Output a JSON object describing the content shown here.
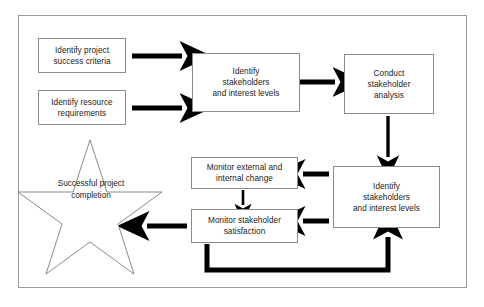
{
  "diagram": {
    "frame": {
      "border_color": "#9a9a9a",
      "background": "#ffffff"
    },
    "style": {
      "box_border_color": "#8c8c8c",
      "arrow_color": "#000000",
      "text_color": "#1a1a1a"
    },
    "nodes": [
      {
        "id": "identify-project-success-criteria",
        "shape": "rectangle",
        "line1": "Identify project",
        "line2": "success criteria",
        "line3": ""
      },
      {
        "id": "identify-resource-requirements",
        "shape": "rectangle",
        "line1": "Identify resource",
        "line2": "requirements",
        "line3": ""
      },
      {
        "id": "identify-stakeholders-and-interest-levels-top",
        "shape": "rectangle",
        "line1": "Identify",
        "line2": "stakeholders",
        "line3": "and interest levels"
      },
      {
        "id": "conduct-stakeholder-analysis",
        "shape": "rectangle",
        "line1": "Conduct",
        "line2": "stakeholder",
        "line3": "analysis"
      },
      {
        "id": "identify-stakeholders-and-interest-levels-bottom",
        "shape": "rectangle",
        "line1": "Identify",
        "line2": "stakeholders",
        "line3": "and interest levels"
      },
      {
        "id": "monitor-external-and-internal-change",
        "shape": "rectangle",
        "line1": "Monitor external and",
        "line2": "internal change",
        "line3": ""
      },
      {
        "id": "monitor-stakeholder-satisfaction",
        "shape": "rectangle",
        "line1": "Monitor stakeholder",
        "line2": "satisfaction",
        "line3": ""
      },
      {
        "id": "successful-project-completion",
        "shape": "star",
        "line1": "Successful",
        "line2": "project",
        "line3": "completion"
      }
    ],
    "connectors": [
      {
        "id": "success-criteria-to-identify-stakeholders",
        "from": "identify-project-success-criteria",
        "to": "identify-stakeholders-and-interest-levels-top",
        "style": "thick-arrow"
      },
      {
        "id": "resource-requirements-to-identify-stakeholders",
        "from": "identify-resource-requirements",
        "to": "identify-stakeholders-and-interest-levels-top",
        "style": "thick-arrow"
      },
      {
        "id": "identify-stakeholders-to-conduct-analysis",
        "from": "identify-stakeholders-and-interest-levels-top",
        "to": "conduct-stakeholder-analysis",
        "style": "thick-arrow"
      },
      {
        "id": "conduct-analysis-to-identify-stakeholders-bottom",
        "from": "conduct-stakeholder-analysis",
        "to": "identify-stakeholders-and-interest-levels-bottom",
        "style": "thin-arrow-down"
      },
      {
        "id": "identify-stakeholders-bottom-to-monitor-change",
        "from": "identify-stakeholders-and-interest-levels-bottom",
        "to": "monitor-external-and-internal-change",
        "style": "thick-arrow-left"
      },
      {
        "id": "identify-stakeholders-bottom-to-monitor-satisfaction",
        "from": "identify-stakeholders-and-interest-levels-bottom",
        "to": "monitor-stakeholder-satisfaction",
        "style": "thick-arrow-left"
      },
      {
        "id": "monitor-change-to-monitor-satisfaction",
        "from": "monitor-external-and-internal-change",
        "to": "monitor-stakeholder-satisfaction",
        "style": "thin-arrow-down"
      },
      {
        "id": "monitor-satisfaction-to-successful-completion",
        "from": "monitor-stakeholder-satisfaction",
        "to": "successful-project-completion",
        "style": "thick-arrow-left"
      },
      {
        "id": "feedback-loop-to-identify-stakeholders-bottom",
        "from": "monitor-stakeholder-satisfaction",
        "to": "identify-stakeholders-and-interest-levels-bottom",
        "style": "thick-elbow-arrow-up"
      }
    ]
  }
}
